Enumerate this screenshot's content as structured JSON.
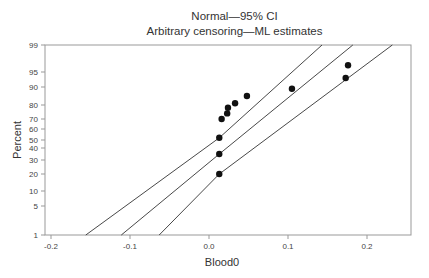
{
  "chart_data": {
    "type": "scatter",
    "title": "Normal—95% CI",
    "subtitle": "Arbitrary censoring—ML estimates",
    "xlabel": "Blood0",
    "ylabel": "Percent",
    "xlim": [
      -0.2075,
      0.255
    ],
    "x_ticks": [
      -0.2,
      -0.1,
      0.0,
      0.1,
      0.2
    ],
    "x_tick_labels": [
      "-0.2",
      "-0.1",
      "0.0",
      "0.1",
      "0.2"
    ],
    "y_scale": "normal-probability",
    "y_ticks": [
      1,
      5,
      10,
      20,
      30,
      40,
      50,
      60,
      70,
      80,
      90,
      95,
      99
    ],
    "y_tick_labels": [
      "1",
      "5",
      "10",
      "20",
      "30",
      "40",
      "50",
      "60",
      "70",
      "80",
      "90",
      "95",
      "99"
    ],
    "grid": false,
    "legend": null,
    "series": [
      {
        "name": "data points",
        "type": "scatter",
        "points": [
          {
            "x": 0.013,
            "y": 20
          },
          {
            "x": 0.013,
            "y": 35
          },
          {
            "x": 0.013,
            "y": 52
          },
          {
            "x": 0.016,
            "y": 70
          },
          {
            "x": 0.023,
            "y": 74
          },
          {
            "x": 0.024,
            "y": 78
          },
          {
            "x": 0.033,
            "y": 81
          },
          {
            "x": 0.048,
            "y": 85
          },
          {
            "x": 0.105,
            "y": 89
          },
          {
            "x": 0.173,
            "y": 93
          },
          {
            "x": 0.176,
            "y": 96
          }
        ]
      },
      {
        "name": "ML fit",
        "type": "line",
        "points": [
          {
            "x": -0.111,
            "y": 1
          },
          {
            "x": 0.013,
            "y": 35
          },
          {
            "x": 0.182,
            "y": 99
          }
        ]
      },
      {
        "name": "lower 95% CI",
        "type": "line",
        "points": [
          {
            "x": -0.156,
            "y": 1
          },
          {
            "x": 0.013,
            "y": 52
          },
          {
            "x": 0.143,
            "y": 99
          }
        ]
      },
      {
        "name": "upper 95% CI",
        "type": "line",
        "points": [
          {
            "x": -0.063,
            "y": 1
          },
          {
            "x": 0.013,
            "y": 20
          },
          {
            "x": 0.232,
            "y": 99
          }
        ]
      }
    ]
  }
}
